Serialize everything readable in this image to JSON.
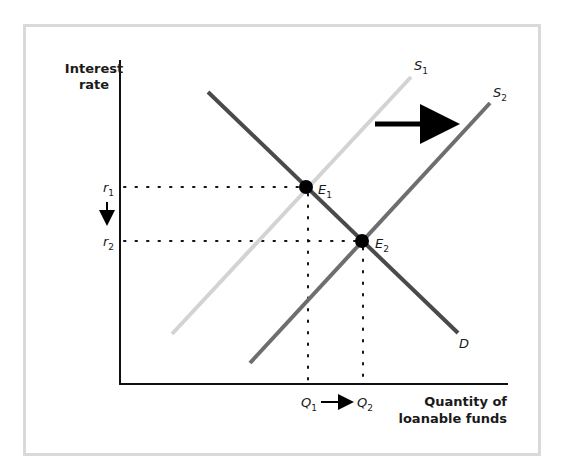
{
  "diagram": {
    "title": "",
    "y_axis_label": [
      "Interest",
      "rate"
    ],
    "x_axis_label": [
      "Quantity of",
      "loanable funds"
    ],
    "curves": [
      {
        "id": "S1",
        "label": "S",
        "sub": "1",
        "color": "#d3d3d3",
        "from": [
          172,
          334
        ],
        "to": [
          411,
          77
        ]
      },
      {
        "id": "S2",
        "label": "S",
        "sub": "2",
        "color": "#6e6e6e",
        "from": [
          250,
          363
        ],
        "to": [
          490,
          103
        ]
      },
      {
        "id": "D",
        "label": "D",
        "sub": "",
        "color": "#4a4a4a",
        "from": [
          208,
          92
        ],
        "to": [
          458,
          333
        ]
      }
    ],
    "equilibria": [
      {
        "id": "E1",
        "label": "E",
        "sub": "1",
        "x": 306,
        "y": 187
      },
      {
        "id": "E2",
        "label": "E",
        "sub": "2",
        "x": 362,
        "y": 241
      }
    ],
    "y_ticks": [
      {
        "label": "r",
        "sub": "1",
        "y": 187
      },
      {
        "label": "r",
        "sub": "2",
        "y": 241
      }
    ],
    "x_ticks": [
      {
        "label": "Q",
        "sub": "1",
        "x": 308
      },
      {
        "label": "Q",
        "sub": "2",
        "x": 363
      }
    ],
    "shift_arrow": {
      "direction": "right",
      "meaning": "supply increases"
    },
    "rate_arrow": {
      "direction": "down",
      "meaning": "interest rate falls"
    },
    "quantity_arrow": {
      "direction": "right",
      "meaning": "quantity rises"
    }
  }
}
